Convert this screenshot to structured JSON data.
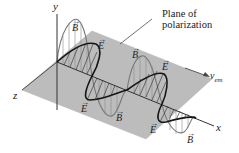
{
  "figure": {
    "axes": {
      "y_label": "y",
      "x_label": "x",
      "z_label": "z"
    },
    "callout": {
      "line1": "Plane of",
      "line2": "polarization"
    },
    "velocity": {
      "symbol": "v",
      "subscript": "em"
    },
    "vector_labels": {
      "E": "E",
      "B": "B",
      "arrow": "→"
    },
    "labels": [
      {
        "id": "B1",
        "text": "B",
        "x": 72,
        "y": 23
      },
      {
        "id": "E1",
        "text": "E",
        "x": 98,
        "y": 41
      },
      {
        "id": "B2",
        "text": "B",
        "x": 132,
        "y": 50
      },
      {
        "id": "E2",
        "text": "E",
        "x": 162,
        "y": 62
      },
      {
        "id": "E3",
        "text": "E",
        "x": 81,
        "y": 104
      },
      {
        "id": "B3",
        "text": "B",
        "x": 116,
        "y": 113
      },
      {
        "id": "E4",
        "text": "E",
        "x": 150,
        "y": 125
      },
      {
        "id": "B5",
        "text": "B",
        "x": 187,
        "y": 135
      }
    ],
    "colors": {
      "plane": "#b8b8b8",
      "plane_edge": "#a8a8a8",
      "e_wave": "#1a1a1a",
      "b_wave": "#6e6e6e",
      "axis": "#333333",
      "text": "#222222"
    }
  }
}
